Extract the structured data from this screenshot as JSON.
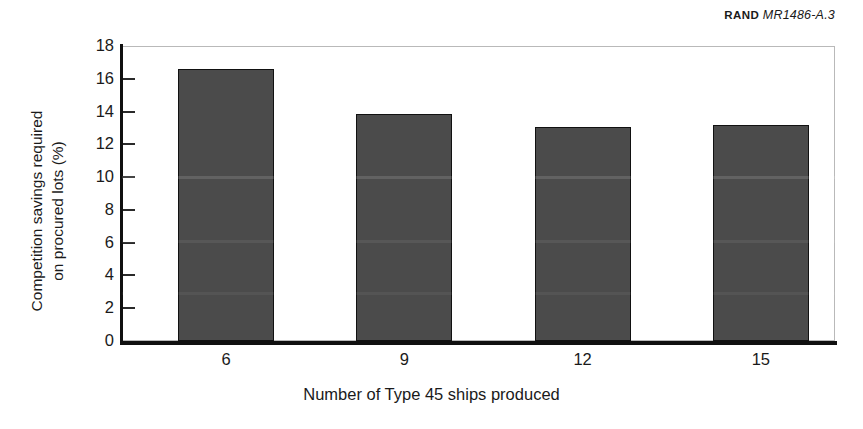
{
  "credit": {
    "org": "RAND",
    "publication_id": "MR1486-A.3"
  },
  "chart_data": {
    "type": "bar",
    "title": "",
    "subtitle": "",
    "xlabel": "Number of Type 45 ships produced",
    "ylabel": "Competition savings required\non procured lots (%)",
    "categories": [
      "6",
      "9",
      "12",
      "15"
    ],
    "values": [
      16.6,
      13.85,
      13.05,
      13.15
    ],
    "series": [
      {
        "name": "Competition savings required on procured lots",
        "values": [
          16.6,
          13.85,
          13.05,
          13.15
        ]
      }
    ],
    "ylim": [
      0,
      18
    ],
    "ytick_labels": [
      "18",
      "16",
      "14",
      "12",
      "10",
      "8",
      "6",
      "4",
      "2",
      "0"
    ],
    "ytick_values": [
      18,
      16,
      14,
      12,
      10,
      8,
      6,
      4,
      2,
      0
    ],
    "xtick_labels": [
      "6",
      "9",
      "12",
      "15"
    ],
    "grid": false,
    "legend": false,
    "legend_position": "none",
    "bar_color": "#4b4b4b",
    "bar_edge_color": "#111111",
    "axis_color": "#101010",
    "plot_border_color": "#b9b9b9",
    "background_color": "#ffffff"
  }
}
